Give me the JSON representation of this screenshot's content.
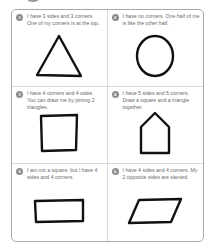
{
  "worksheet": {
    "cards": [
      {
        "number": "1",
        "clue": "I have 3 sides and 3 corners. One of my corners is at the top.",
        "shape": "triangle"
      },
      {
        "number": "2",
        "clue": "I have no corners. One half of me is like the other half.",
        "shape": "circle"
      },
      {
        "number": "3",
        "clue": "I have 4 corners and 4 sides. You can draw me by joining 2 triangles.",
        "shape": "square"
      },
      {
        "number": "4",
        "clue": "I have 5 sides and 5 corners. Draw a square and a triangle together.",
        "shape": "pentagon-house"
      },
      {
        "number": "5",
        "clue": "I am not a square, but I have 4 sides and 4 corners.",
        "shape": "rectangle"
      },
      {
        "number": "6",
        "clue": "I have 4 sides and 4 corners. My 2 opposite sides are slanted.",
        "shape": "parallelogram"
      }
    ],
    "colors": {
      "frame_border": "#a8a8a8",
      "divider": "#dadada",
      "badge": "#8c8c8c",
      "clue_text": "#6b6b6b",
      "shape_stroke": "#111111"
    }
  }
}
